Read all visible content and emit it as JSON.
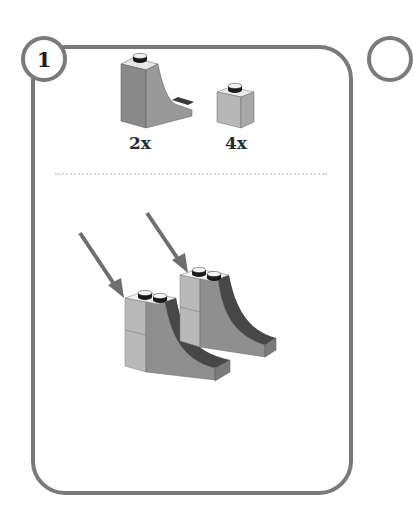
{
  "step": {
    "number": "1",
    "next_number": "2"
  },
  "parts_list": [
    {
      "part": "curved-slope-brick",
      "quantity": "2x",
      "color": "#8f8f8f"
    },
    {
      "part": "1x1-brick",
      "quantity": "4x",
      "color": "#b5b5b5"
    }
  ],
  "assembly": {
    "description": "Two slope bricks each topped with stacked 1x1 bricks; arrows indicate placement",
    "arrows": 2
  },
  "colors": {
    "frame": "#7a7a7a",
    "light_gray": "#b5b5b5",
    "mid_gray": "#8f8f8f",
    "dark_gray": "#474747",
    "stud": "#1a1a1a"
  }
}
